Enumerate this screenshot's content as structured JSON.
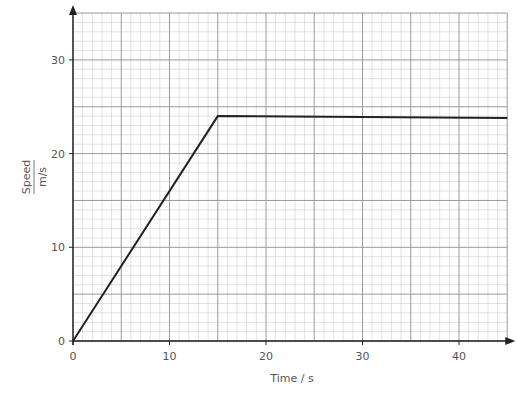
{
  "chart_data": {
    "type": "line",
    "title": "",
    "xlabel": "Time / s",
    "ylabel": "Speed",
    "ylabel_unit": "m/s",
    "xlim": [
      0,
      45
    ],
    "ylim": [
      0,
      35
    ],
    "x_ticks": [
      0,
      10,
      20,
      30,
      40
    ],
    "y_ticks": [
      0,
      10,
      20,
      30
    ],
    "grid": {
      "major_step_x": 5,
      "minor_step_x": 1,
      "major_step_y": 5,
      "minor_step_y": 1
    },
    "series": [
      {
        "name": "speed",
        "color": "#222222",
        "x": [
          0,
          15,
          45
        ],
        "y": [
          0,
          24,
          23.8
        ]
      }
    ]
  },
  "labels": {
    "xlabel": "Time / s",
    "ylabel": "Speed",
    "ylabel_unit": "m/s"
  }
}
